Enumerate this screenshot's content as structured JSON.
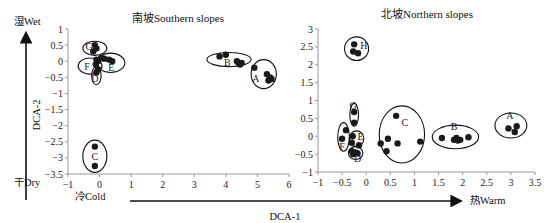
{
  "figure": {
    "wet_label": "湿Wet",
    "dry_label": "干Dry",
    "cold_label": "冷Cold",
    "warm_label": "热Warm",
    "ylabel": "DCA-2",
    "xlabel": "DCA-1"
  },
  "chart_data": [
    {
      "type": "scatter",
      "title": "南坡Southern slopes",
      "xlabel": "DCA-1",
      "ylabel": "DCA-2",
      "xlim": [
        -1,
        6
      ],
      "ylim": [
        -3.5,
        1
      ],
      "xticks": [
        "-1",
        "0",
        "1",
        "2",
        "3",
        "4",
        "5",
        "6"
      ],
      "yticks": [
        "1",
        "0.5",
        "0",
        "-0.5",
        "-1",
        "-1.5",
        "-2",
        "-2.5",
        "-3",
        "-3.5"
      ],
      "groups": [
        {
          "name": "G",
          "points": [
            [
              -0.15,
              0.5
            ],
            [
              -0.1,
              0.4
            ],
            [
              -0.2,
              0.3
            ]
          ],
          "ellipse": {
            "cx": -0.15,
            "cy": 0.4,
            "rx": 0.38,
            "ry": 0.22
          },
          "label_at": [
            -0.33,
            0.45
          ]
        },
        {
          "name": "F",
          "points": [
            [
              -0.1,
              0.05
            ],
            [
              -0.05,
              0.0
            ],
            [
              -0.12,
              -0.1
            ]
          ],
          "ellipse": {
            "cx": -0.3,
            "cy": -0.15,
            "rx": 0.38,
            "ry": 0.25
          },
          "label_at": [
            -0.4,
            -0.15
          ]
        },
        {
          "name": "E",
          "points": [
            [
              0.05,
              0.1
            ],
            [
              0.15,
              0.08
            ],
            [
              0.3,
              0.05
            ],
            [
              0.4,
              0.0
            ]
          ],
          "ellipse": {
            "cx": 0.35,
            "cy": -0.05,
            "rx": 0.45,
            "ry": 0.3
          },
          "label_at": [
            0.37,
            -0.2
          ]
        },
        {
          "name": "D",
          "points": [
            [
              -0.05,
              -0.25
            ],
            [
              -0.1,
              -0.35
            ]
          ],
          "ellipse": {
            "cx": -0.1,
            "cy": -0.45,
            "rx": 0.15,
            "ry": 0.28
          },
          "label_at": [
            -0.15,
            -0.55
          ]
        },
        {
          "name": "C",
          "points": [
            [
              -0.15,
              -2.65
            ],
            [
              -0.15,
              -3.25
            ]
          ],
          "ellipse": {
            "cx": -0.15,
            "cy": -2.95,
            "rx": 0.38,
            "ry": 0.5
          },
          "label_at": [
            -0.15,
            -2.95
          ]
        },
        {
          "name": "B",
          "points": [
            [
              3.8,
              0.15
            ],
            [
              4.0,
              0.2
            ],
            [
              4.35,
              0.0
            ],
            [
              4.4,
              -0.05
            ],
            [
              4.5,
              -0.05
            ],
            [
              4.45,
              -0.1
            ]
          ],
          "ellipse": {
            "cx": 4.1,
            "cy": 0.05,
            "rx": 0.7,
            "ry": 0.22
          },
          "label_at": [
            4.05,
            -0.05
          ]
        },
        {
          "name": "A",
          "points": [
            [
              4.9,
              -0.2
            ],
            [
              5.3,
              -0.4
            ],
            [
              5.4,
              -0.5
            ],
            [
              5.35,
              -0.6
            ],
            [
              5.45,
              -0.55
            ]
          ],
          "ellipse": {
            "cx": 5.2,
            "cy": -0.4,
            "rx": 0.4,
            "ry": 0.45
          },
          "label_at": [
            4.95,
            -0.55
          ]
        }
      ]
    },
    {
      "type": "scatter",
      "title": "北坡Northern slopes",
      "xlabel": "DCA-1",
      "ylabel": "DCA-2",
      "xlim": [
        -1,
        3.5
      ],
      "ylim": [
        -1,
        3
      ],
      "xticks": [
        "-1",
        "-0.5",
        "0",
        "0.5",
        "1",
        "1.5",
        "2",
        "2.5",
        "3",
        "3.5"
      ],
      "yticks": [
        "3",
        "2.5",
        "2",
        "1.5",
        "1",
        "0.5",
        "0",
        "-0.5",
        "-1"
      ],
      "groups": [
        {
          "name": "H",
          "points": [
            [
              -0.25,
              2.57
            ],
            [
              -0.27,
              2.37
            ],
            [
              -0.17,
              2.32
            ]
          ],
          "ellipse": {
            "cx": -0.2,
            "cy": 2.45,
            "rx": 0.25,
            "ry": 0.33
          },
          "label_at": [
            -0.05,
            2.55
          ]
        },
        {
          "name": "G",
          "points": [
            [
              -0.25,
              0.68
            ],
            [
              -0.25,
              0.38
            ]
          ],
          "ellipse": {
            "cx": -0.25,
            "cy": 0.6,
            "rx": 0.09,
            "ry": 0.32
          },
          "label_at": [
            -0.27,
            0.85
          ]
        },
        {
          "name": "F",
          "points": [
            [
              -0.42,
              0.17
            ],
            [
              -0.5,
              -0.07
            ]
          ],
          "ellipse": {
            "cx": -0.47,
            "cy": -0.02,
            "rx": 0.12,
            "ry": 0.4
          },
          "label_at": [
            -0.5,
            -0.3
          ]
        },
        {
          "name": "E",
          "points": [
            [
              -0.28,
              0.0
            ],
            [
              -0.3,
              -0.18
            ],
            [
              -0.15,
              -0.25
            ]
          ],
          "ellipse": {
            "cx": -0.2,
            "cy": -0.07,
            "rx": 0.15,
            "ry": 0.22
          },
          "label_at": [
            -0.12,
            -0.02
          ]
        },
        {
          "name": "D",
          "points": [
            [
              -0.3,
              -0.42
            ],
            [
              -0.27,
              -0.5
            ],
            [
              -0.22,
              -0.45
            ],
            [
              -0.18,
              -0.48
            ]
          ],
          "ellipse": {
            "cx": -0.22,
            "cy": -0.47,
            "rx": 0.15,
            "ry": 0.18
          },
          "label_at": [
            -0.18,
            -0.63
          ]
        },
        {
          "name": "C",
          "points": [
            [
              0.62,
              0.57
            ],
            [
              0.3,
              -0.2
            ],
            [
              0.45,
              -0.07
            ],
            [
              0.65,
              -0.2
            ],
            [
              1.12,
              -0.15
            ],
            [
              0.42,
              -0.42
            ]
          ],
          "ellipse": {
            "cx": 0.74,
            "cy": 0.05,
            "rx": 0.47,
            "ry": 0.8
          },
          "label_at": [
            0.8,
            0.38
          ]
        },
        {
          "name": "B",
          "points": [
            [
              1.57,
              -0.05
            ],
            [
              1.82,
              -0.1
            ],
            [
              1.87,
              -0.05
            ],
            [
              1.9,
              -0.12
            ],
            [
              1.95,
              -0.1
            ],
            [
              2.12,
              -0.03
            ]
          ],
          "ellipse": {
            "cx": 1.85,
            "cy": -0.02,
            "rx": 0.48,
            "ry": 0.33
          },
          "label_at": [
            1.82,
            0.27
          ]
        },
        {
          "name": "A",
          "points": [
            [
              2.95,
              0.22
            ],
            [
              3.12,
              0.28
            ],
            [
              3.08,
              0.12
            ]
          ],
          "ellipse": {
            "cx": 3.0,
            "cy": 0.3,
            "rx": 0.33,
            "ry": 0.35
          },
          "label_at": [
            2.98,
            0.57
          ]
        }
      ]
    }
  ]
}
